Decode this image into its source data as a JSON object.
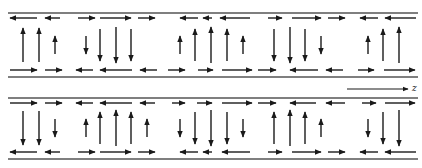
{
  "diagram": {
    "type": "vector-field-waveguide",
    "colors": {
      "stroke": "#1a1a1a",
      "rail": "#555555",
      "background": "#ffffff"
    },
    "axis": {
      "label": "z",
      "x1": 347,
      "x2": 408,
      "y": 89,
      "label_x": 412,
      "label_y": 83
    },
    "panels": [
      {
        "name": "upper-panel",
        "rail_top_y": 13,
        "rail_bottom_y": 77,
        "top_row_y": 18,
        "bottom_row_y": 70,
        "vertical_mid_y": 45,
        "top_row": [
          {
            "x1": 37,
            "x2": 10
          },
          {
            "x1": 60,
            "x2": 45
          },
          {
            "x1": 78,
            "x2": 95
          },
          {
            "x1": 100,
            "x2": 131
          },
          {
            "x1": 138,
            "x2": 155
          },
          {
            "x1": 198,
            "x2": 180
          },
          {
            "x1": 212,
            "x2": 203
          },
          {
            "x1": 250,
            "x2": 220
          },
          {
            "x1": 268,
            "x2": 282
          },
          {
            "x1": 292,
            "x2": 321
          },
          {
            "x1": 328,
            "x2": 345
          },
          {
            "x1": 378,
            "x2": 360
          },
          {
            "x1": 416,
            "x2": 385
          }
        ],
        "bottom_row": [
          {
            "x1": 10,
            "x2": 37
          },
          {
            "x1": 45,
            "x2": 62
          },
          {
            "x1": 93,
            "x2": 76
          },
          {
            "x1": 132,
            "x2": 100
          },
          {
            "x1": 157,
            "x2": 140
          },
          {
            "x1": 168,
            "x2": 185
          },
          {
            "x1": 198,
            "x2": 213
          },
          {
            "x1": 222,
            "x2": 252
          },
          {
            "x1": 258,
            "x2": 276
          },
          {
            "x1": 318,
            "x2": 290
          },
          {
            "x1": 343,
            "x2": 326
          },
          {
            "x1": 358,
            "x2": 374
          },
          {
            "x1": 384,
            "x2": 415
          }
        ],
        "verticals": [
          {
            "x": 23,
            "dir": "up",
            "len": 34
          },
          {
            "x": 39,
            "dir": "up",
            "len": 34
          },
          {
            "x": 55,
            "dir": "up",
            "len": 18
          },
          {
            "x": 86,
            "dir": "down",
            "len": 18
          },
          {
            "x": 100,
            "dir": "down",
            "len": 32
          },
          {
            "x": 116,
            "dir": "down",
            "len": 36
          },
          {
            "x": 131,
            "dir": "down",
            "len": 32
          },
          {
            "x": 180,
            "dir": "up",
            "len": 18
          },
          {
            "x": 195,
            "dir": "up",
            "len": 32
          },
          {
            "x": 211,
            "dir": "up",
            "len": 36
          },
          {
            "x": 227,
            "dir": "up",
            "len": 32
          },
          {
            "x": 243,
            "dir": "up",
            "len": 18
          },
          {
            "x": 274,
            "dir": "down",
            "len": 32
          },
          {
            "x": 290,
            "dir": "down",
            "len": 36
          },
          {
            "x": 305,
            "dir": "down",
            "len": 32
          },
          {
            "x": 321,
            "dir": "down",
            "len": 18
          },
          {
            "x": 368,
            "dir": "up",
            "len": 18
          },
          {
            "x": 383,
            "dir": "up",
            "len": 32
          },
          {
            "x": 399,
            "dir": "up",
            "len": 36
          }
        ]
      },
      {
        "name": "lower-panel",
        "rail_top_y": 98,
        "rail_bottom_y": 159,
        "top_row_y": 103,
        "bottom_row_y": 152,
        "vertical_mid_y": 128,
        "top_row": [
          {
            "x1": 10,
            "x2": 37
          },
          {
            "x1": 45,
            "x2": 62
          },
          {
            "x1": 93,
            "x2": 76
          },
          {
            "x1": 132,
            "x2": 100
          },
          {
            "x1": 155,
            "x2": 140
          },
          {
            "x1": 172,
            "x2": 185
          },
          {
            "x1": 197,
            "x2": 212
          },
          {
            "x1": 222,
            "x2": 252
          },
          {
            "x1": 258,
            "x2": 276
          },
          {
            "x1": 316,
            "x2": 290
          },
          {
            "x1": 345,
            "x2": 326
          },
          {
            "x1": 362,
            "x2": 376
          },
          {
            "x1": 385,
            "x2": 415
          }
        ],
        "bottom_row": [
          {
            "x1": 37,
            "x2": 10
          },
          {
            "x1": 60,
            "x2": 45
          },
          {
            "x1": 78,
            "x2": 95
          },
          {
            "x1": 100,
            "x2": 131
          },
          {
            "x1": 138,
            "x2": 155
          },
          {
            "x1": 198,
            "x2": 180
          },
          {
            "x1": 212,
            "x2": 203
          },
          {
            "x1": 250,
            "x2": 222
          },
          {
            "x1": 268,
            "x2": 282
          },
          {
            "x1": 292,
            "x2": 321
          },
          {
            "x1": 328,
            "x2": 345
          },
          {
            "x1": 378,
            "x2": 360
          },
          {
            "x1": 416,
            "x2": 385
          }
        ],
        "verticals": [
          {
            "x": 23,
            "dir": "down",
            "len": 34
          },
          {
            "x": 39,
            "dir": "down",
            "len": 34
          },
          {
            "x": 55,
            "dir": "down",
            "len": 18
          },
          {
            "x": 86,
            "dir": "up",
            "len": 18
          },
          {
            "x": 100,
            "dir": "up",
            "len": 32
          },
          {
            "x": 116,
            "dir": "up",
            "len": 36
          },
          {
            "x": 131,
            "dir": "up",
            "len": 32
          },
          {
            "x": 147,
            "dir": "up",
            "len": 18
          },
          {
            "x": 180,
            "dir": "down",
            "len": 18
          },
          {
            "x": 195,
            "dir": "down",
            "len": 32
          },
          {
            "x": 211,
            "dir": "down",
            "len": 36
          },
          {
            "x": 227,
            "dir": "down",
            "len": 32
          },
          {
            "x": 243,
            "dir": "down",
            "len": 18
          },
          {
            "x": 274,
            "dir": "up",
            "len": 32
          },
          {
            "x": 290,
            "dir": "up",
            "len": 36
          },
          {
            "x": 305,
            "dir": "up",
            "len": 32
          },
          {
            "x": 321,
            "dir": "up",
            "len": 18
          },
          {
            "x": 368,
            "dir": "down",
            "len": 18
          },
          {
            "x": 383,
            "dir": "down",
            "len": 32
          },
          {
            "x": 399,
            "dir": "down",
            "len": 36
          }
        ]
      }
    ]
  }
}
